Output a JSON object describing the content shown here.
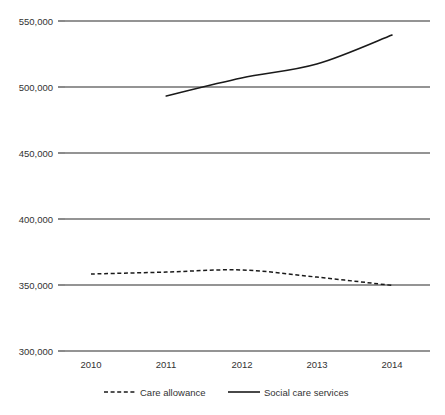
{
  "chart_data": {
    "type": "line",
    "title": "",
    "subtitle": "",
    "xlabel": "",
    "ylabel": "",
    "categories": [
      "2010",
      "2011",
      "2012",
      "2013",
      "2014"
    ],
    "x": [
      2010,
      2011,
      2012,
      2013,
      2014
    ],
    "ylim": [
      300000,
      550000
    ],
    "ytick_values": [
      550000,
      500000,
      450000,
      400000,
      350000,
      300000
    ],
    "ytick_labels": [
      "550,000",
      "500,000",
      "450,000",
      "400,000",
      "350,000",
      "300,000"
    ],
    "xtick_labels": [
      "2010",
      "2011",
      "2012",
      "2013",
      "2014"
    ],
    "grid": "horizontal",
    "legend_position": "bottom",
    "series": [
      {
        "name": "Care allowance",
        "style": "dashed",
        "color": "#1a1a1a",
        "x": [
          2010,
          2011,
          2012,
          2013,
          2014
        ],
        "values": [
          358300,
          359800,
          361400,
          356000,
          349700
        ]
      },
      {
        "name": "Social care services",
        "style": "solid",
        "color": "#1a1a1a",
        "x": [
          2011,
          2012,
          2013,
          2014
        ],
        "values": [
          493200,
          506800,
          517400,
          539400
        ]
      }
    ],
    "annotations": []
  },
  "legend": {
    "items": [
      {
        "label": "Care allowance",
        "style": "dashed"
      },
      {
        "label": "Social care services",
        "style": "solid"
      }
    ]
  },
  "axes": {
    "y": {
      "labels": [
        {
          "text": "550,000"
        },
        {
          "text": "500,000"
        },
        {
          "text": "450,000"
        },
        {
          "text": "400,000"
        },
        {
          "text": "350,000"
        },
        {
          "text": "300,000"
        }
      ]
    },
    "x": {
      "labels": [
        {
          "text": "2010"
        },
        {
          "text": "2011"
        },
        {
          "text": "2012"
        },
        {
          "text": "2013"
        },
        {
          "text": "2014"
        }
      ]
    }
  }
}
